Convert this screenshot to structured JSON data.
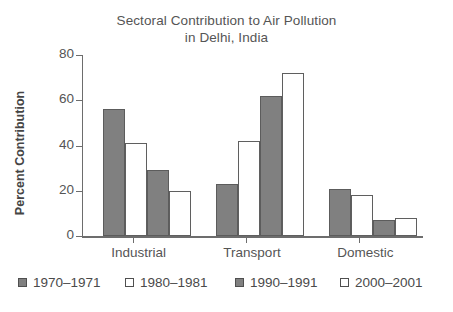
{
  "chart_data": {
    "type": "bar",
    "title": "Sectoral Contribution to Air Pollution in Delhi, India",
    "title_lines": [
      "Sectoral Contribution to Air Pollution",
      "in Delhi, India"
    ],
    "xlabel": "",
    "ylabel": "Percent Contribution",
    "ylim": [
      0,
      80
    ],
    "yticks": [
      0,
      20,
      40,
      60,
      80
    ],
    "ytick_labels": [
      "0",
      "20",
      "40",
      "60",
      "80"
    ],
    "grid": false,
    "legend_position": "bottom",
    "categories": [
      "Industrial",
      "Transport",
      "Domestic"
    ],
    "series": [
      {
        "name": "1970–1971",
        "swatch": "filled",
        "color": "#808080",
        "values": [
          56,
          23,
          21
        ]
      },
      {
        "name": "1980–1981",
        "swatch": "hollow",
        "color": "#ffffff",
        "values": [
          41,
          42,
          18
        ]
      },
      {
        "name": "1990–1991",
        "swatch": "filled",
        "color": "#808080",
        "values": [
          29,
          62,
          7
        ]
      },
      {
        "name": "2000–2001",
        "swatch": "hollow",
        "color": "#ffffff",
        "values": [
          20,
          72,
          8
        ]
      }
    ]
  },
  "colors": {
    "fill_gray": "#808080",
    "outline": "#5c5c5c",
    "axis": "#6d6d6d",
    "text": "#555555",
    "background": "#ffffff"
  }
}
